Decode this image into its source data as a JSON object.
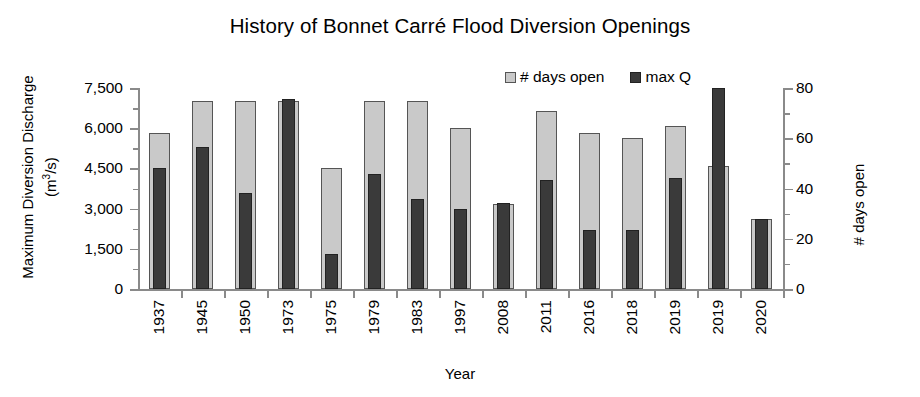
{
  "chart_data": {
    "type": "bar",
    "title": "History of Bonnet Carré Flood Diversion Openings",
    "xlabel": "Year",
    "ylabel_left_line1": "Maximum Diversion Discharge",
    "ylabel_left_line2": "(m3/s)",
    "ylabel_right": "# days open",
    "grid": false,
    "legend_position": "top-center",
    "categories": [
      "1937",
      "1945",
      "1950",
      "1973",
      "1975",
      "1979",
      "1983",
      "1997",
      "2008",
      "2011",
      "2016",
      "2018",
      "2019",
      "2019",
      "2020"
    ],
    "left_axis": {
      "label": "Maximum Diversion Discharge (m3/s)",
      "ylim": [
        0,
        7500
      ],
      "ticks": [
        "0",
        "1,500",
        "3,000",
        "4,500",
        "6,000",
        "7,500"
      ],
      "tick_values": [
        0,
        1500,
        3000,
        4500,
        6000,
        7500
      ],
      "minor_step": 750
    },
    "right_axis": {
      "label": "# days open",
      "ylim": [
        0,
        80
      ],
      "ticks": [
        "0",
        "20",
        "40",
        "60",
        "80"
      ],
      "tick_values": [
        0,
        20,
        40,
        60,
        80
      ],
      "minor_step": 10
    },
    "series": [
      {
        "name": "# days open",
        "axis": "right",
        "color": "#c9c9c9",
        "values": [
          62,
          75,
          75,
          75,
          48,
          75,
          75,
          64,
          34,
          71,
          62,
          60,
          65,
          49,
          28
        ]
      },
      {
        "name": "max Q",
        "axis": "left",
        "color": "#3a3a3a",
        "values": [
          4500,
          5300,
          3600,
          7100,
          1300,
          4300,
          3350,
          3000,
          3200,
          4050,
          2200,
          2200,
          4150,
          7500,
          2600
        ]
      }
    ]
  },
  "legend": {
    "days_label": "# days open",
    "maxq_label": "max Q"
  }
}
